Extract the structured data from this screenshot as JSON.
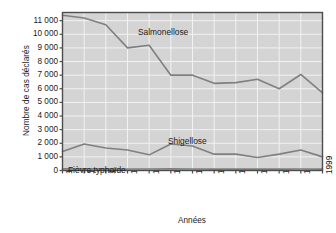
{
  "chart_data": {
    "type": "line",
    "title": "",
    "xlabel": "Années",
    "ylabel": "Nombre de cas déclarés",
    "x": [
      1987,
      1988,
      1989,
      1990,
      1991,
      1992,
      1993,
      1994,
      1995,
      1996,
      1997,
      1998,
      1999
    ],
    "categories": [
      "1987",
      "1988",
      "1989",
      "1990",
      "1991",
      "1992",
      "1993",
      "1994",
      "1995",
      "1996",
      "1997",
      "1998",
      "1999"
    ],
    "ylim": [
      0,
      11600
    ],
    "xlim": [
      1987,
      1999
    ],
    "yticks": [
      0,
      1000,
      2000,
      3000,
      4000,
      5000,
      6000,
      7000,
      8000,
      9000,
      10000,
      11000
    ],
    "ytick_labels": [
      "0",
      "1 000",
      "2 000",
      "3 000",
      "4 000",
      "5 000",
      "6 000",
      "7 000",
      "8 000",
      "9 000",
      "10 000",
      "11 000"
    ],
    "grid": true,
    "legend_position": "inline-annotations",
    "plot_background": "#d4d4d4",
    "grid_color": "#f2f2f2",
    "line_color": "#808080",
    "axis_color": "#4d4d4d",
    "series": [
      {
        "name": "Salmonellose",
        "color": "#808080",
        "values": [
          11400,
          11200,
          10700,
          9000,
          9200,
          7000,
          7000,
          6400,
          6450,
          6700,
          6000,
          7050,
          5700
        ]
      },
      {
        "name": "Shigellose",
        "color": "#808080",
        "values": [
          1400,
          1950,
          1650,
          1500,
          1150,
          1950,
          1800,
          1200,
          1200,
          950,
          1200,
          1500,
          1000
        ]
      },
      {
        "name": "Fièvre typhoïde",
        "color": "#808080",
        "values": [
          120,
          130,
          120,
          110,
          110,
          120,
          110,
          100,
          100,
          100,
          100,
          110,
          100
        ]
      }
    ]
  },
  "annotations": {
    "salmonellose": "Salmonellose",
    "shigellose": "Shigellose",
    "typhoide": "Fièvre typhoïde"
  },
  "axes": {
    "y_title": "Nombre de cas déclarés",
    "x_title": "Années"
  }
}
